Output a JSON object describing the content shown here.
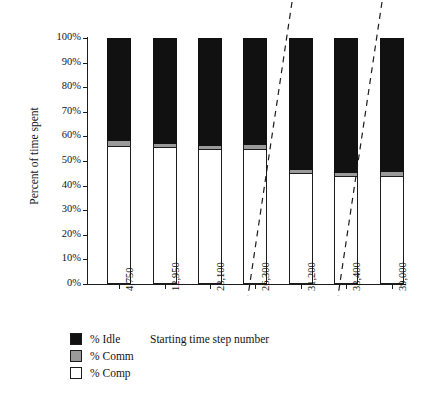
{
  "chart_data": {
    "type": "bar",
    "subtype": "stacked-bar-100-percent",
    "title": "",
    "xlabel": "Starting time step number",
    "ylabel": "Percent of time spent",
    "categories": [
      "4,750",
      "12,950",
      "23,100",
      "26,300",
      "31,200",
      "33,400",
      "39,000"
    ],
    "series": [
      {
        "name": "% Comp",
        "color": "#ffffff",
        "values": [
          56,
          55.5,
          55,
          55,
          45,
          44,
          44
        ]
      },
      {
        "name": "% Comm",
        "color": "#9a9a9a",
        "values": [
          2,
          1.5,
          1,
          1.5,
          1.5,
          1,
          1.5
        ]
      },
      {
        "name": "% Idle",
        "color": "#111111",
        "values": [
          42,
          43,
          44,
          43.5,
          53.5,
          55,
          54.5
        ]
      }
    ],
    "ylim": [
      0,
      100
    ],
    "yticks": [
      "0%",
      "10%",
      "20%",
      "30%",
      "40%",
      "50%",
      "60%",
      "70%",
      "80%",
      "90%",
      "100%"
    ],
    "ytick_values": [
      0,
      10,
      20,
      30,
      40,
      50,
      60,
      70,
      80,
      90,
      100
    ],
    "grid": false,
    "legend_position": "bottom-left",
    "legend": [
      {
        "label": "% Idle",
        "color": "#111111"
      },
      {
        "label": "% Comm",
        "color": "#9a9a9a"
      },
      {
        "label": "% Comp",
        "color": "#ffffff"
      }
    ],
    "annotations": [
      {
        "name": "axis-break-line-1",
        "style": "dashed-diagonal"
      },
      {
        "name": "axis-break-line-2",
        "style": "dashed-diagonal"
      }
    ]
  }
}
